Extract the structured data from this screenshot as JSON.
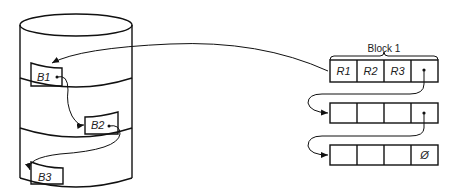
{
  "disk": {
    "blocks": [
      {
        "label": "B1"
      },
      {
        "label": "B2"
      },
      {
        "label": "B3"
      }
    ]
  },
  "chain": {
    "title": "Block 1",
    "rows": [
      {
        "cells": [
          "R1",
          "R2",
          "R3",
          ""
        ]
      },
      {
        "cells": [
          "",
          "",
          "",
          ""
        ]
      },
      {
        "cells": [
          "",
          "",
          "",
          "Ø"
        ]
      }
    ]
  }
}
